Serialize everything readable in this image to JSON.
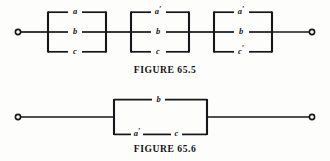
{
  "page": {
    "background_color": "#fdfdfb",
    "ink_color": "#17161a"
  },
  "figures": [
    {
      "id": "figure-65-5",
      "caption": "FIGURE 65.5",
      "description": "Three identical parallel three-branch networks connected in series between two terminals",
      "terminals": [
        "left-open-terminal",
        "right-open-terminal"
      ],
      "blocks": [
        {
          "index": 1,
          "branches": [
            {
              "position": "top",
              "label": "a",
              "prime": ""
            },
            {
              "position": "middle",
              "label": "b",
              "prime": ""
            },
            {
              "position": "bottom",
              "label": "c",
              "prime": ""
            }
          ]
        },
        {
          "index": 2,
          "branches": [
            {
              "position": "top",
              "label": "a",
              "prime": "′"
            },
            {
              "position": "middle",
              "label": "b",
              "prime": ""
            },
            {
              "position": "bottom",
              "label": "c",
              "prime": ""
            }
          ]
        },
        {
          "index": 3,
          "branches": [
            {
              "position": "top",
              "label": "a",
              "prime": "′"
            },
            {
              "position": "middle",
              "label": "b",
              "prime": ""
            },
            {
              "position": "bottom",
              "label": "c",
              "prime": "′"
            }
          ]
        }
      ]
    },
    {
      "id": "figure-65-6",
      "caption": "FIGURE 65.6",
      "description": "Single parallel network: branch b in parallel with series combination of a-prime and c",
      "terminals": [
        "left-open-terminal",
        "right-open-terminal"
      ],
      "branches": [
        {
          "position": "top",
          "elements": [
            {
              "label": "b",
              "prime": ""
            }
          ]
        },
        {
          "position": "bottom",
          "elements": [
            {
              "label": "a",
              "prime": "′"
            },
            {
              "label": "c",
              "prime": ""
            }
          ]
        }
      ]
    }
  ]
}
